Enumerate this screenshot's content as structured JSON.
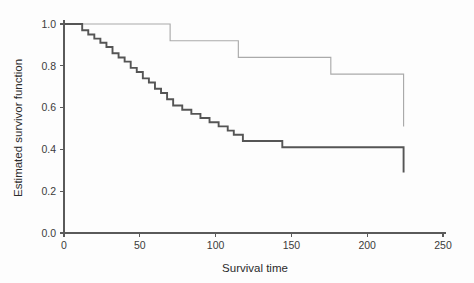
{
  "chart_data": {
    "type": "line",
    "subtype": "kaplan-meier-step",
    "title": "",
    "xlabel": "Survival time",
    "ylabel": "Estimated survivor function",
    "xlim": [
      0,
      250
    ],
    "ylim": [
      0.0,
      1.0
    ],
    "xticks": [
      0,
      50,
      100,
      150,
      200,
      250
    ],
    "xtick_labels": [
      "0",
      "50",
      "100",
      "150",
      "200",
      "250"
    ],
    "yticks": [
      0.0,
      0.2,
      0.4,
      0.6,
      0.8,
      1.0
    ],
    "ytick_labels": [
      "0.0",
      "0.2",
      "0.4",
      "0.6",
      "0.8",
      "1.0"
    ],
    "grid": false,
    "legend": "none",
    "axis_style": "left-and-bottom-spines",
    "colors": {
      "group_1_stroke": "#555555",
      "group_2_stroke": "#aaaaaa",
      "axis": "#5a5a5a",
      "text": "#2b2b2b",
      "background": "#fdfdfd"
    },
    "series": [
      {
        "name": "group-1-lower-survival",
        "style": "solid-dark-thick",
        "color": "#555555",
        "x": [
          0,
          6,
          12,
          16,
          20,
          24,
          28,
          32,
          36,
          40,
          44,
          48,
          52,
          56,
          60,
          64,
          68,
          72,
          78,
          84,
          90,
          96,
          102,
          108,
          112,
          118,
          144,
          224
        ],
        "y": [
          1.0,
          1.0,
          0.97,
          0.95,
          0.93,
          0.91,
          0.89,
          0.86,
          0.84,
          0.82,
          0.79,
          0.77,
          0.74,
          0.72,
          0.69,
          0.67,
          0.64,
          0.61,
          0.59,
          0.57,
          0.55,
          0.53,
          0.51,
          0.49,
          0.47,
          0.44,
          0.41,
          0.29
        ]
      },
      {
        "name": "group-2-higher-survival",
        "style": "solid-light-thin",
        "color": "#aaaaaa",
        "x": [
          0,
          28,
          70,
          115,
          176,
          224
        ],
        "y": [
          1.0,
          1.0,
          0.92,
          0.84,
          0.76,
          0.51
        ]
      }
    ]
  },
  "axes": {
    "x_title": "Survival time",
    "y_title": "Estimated survivor function"
  }
}
